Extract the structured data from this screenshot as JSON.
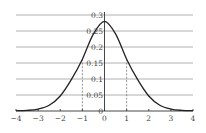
{
  "chart_data": {
    "type": "line",
    "title": "",
    "xlabel": "",
    "ylabel": "",
    "xlim": [
      -4,
      4
    ],
    "ylim": [
      0,
      0.3
    ],
    "grid": {
      "horizontal": true,
      "vertical": false
    },
    "legend": null,
    "x_ticks": [
      "-4",
      "-3",
      "-2",
      "-1",
      "0",
      "1",
      "2",
      "3",
      "4"
    ],
    "y_ticks": [
      "0",
      "0.05",
      "0.1",
      "0.15",
      "0.2",
      "0.25",
      "0.3"
    ],
    "x_tick_values": [
      -4,
      -3,
      -2,
      -1,
      0,
      1,
      2,
      3,
      4
    ],
    "y_tick_values": [
      0,
      0.05,
      0.1,
      0.15,
      0.2,
      0.25,
      0.3
    ],
    "series": [
      {
        "name": "bell curve",
        "x": [
          -4,
          -3.5,
          -3,
          -2.5,
          -2,
          -1.5,
          -1,
          -0.5,
          0,
          0.5,
          1,
          1.5,
          2,
          2.5,
          3,
          3.5,
          4
        ],
        "values": [
          0.001,
          0.002,
          0.006,
          0.018,
          0.047,
          0.098,
          0.162,
          0.241,
          0.28,
          0.241,
          0.162,
          0.098,
          0.047,
          0.018,
          0.006,
          0.002,
          0.001
        ]
      }
    ],
    "annotations": [
      {
        "type": "dashed-vertical",
        "x": -1,
        "y_top": 0.162
      },
      {
        "type": "dashed-vertical",
        "x": 1,
        "y_top": 0.162
      }
    ]
  },
  "colors": {
    "curve": "#222222",
    "grid": "#b0b0b0",
    "axis": "#333333",
    "labels": "#444444",
    "dashed": "#666666"
  }
}
